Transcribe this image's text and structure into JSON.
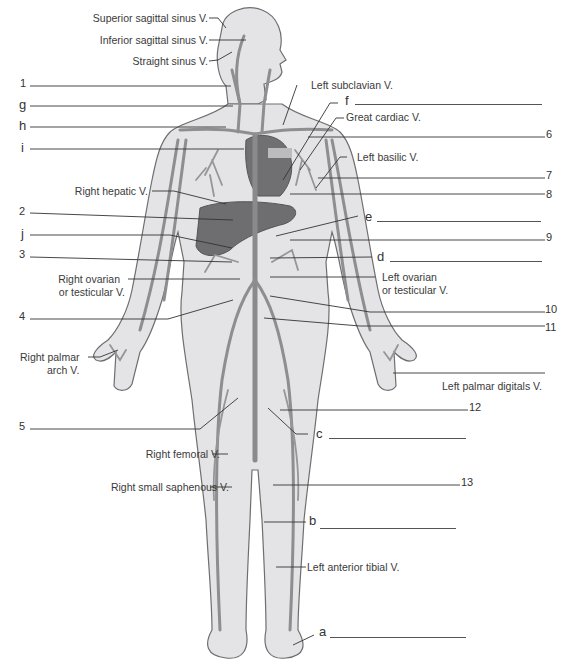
{
  "figure": {
    "named_labels": {
      "superior_sagittal_sinus": "Superior sagittal sinus  V.",
      "inferior_sagittal_sinus": "Inferior sagittal sinus  V.",
      "straight_sinus": "Straight sinus  V.",
      "left_subclavian": "Left subclavian  V.",
      "great_cardiac": "Great cardiac  V.",
      "left_basilic": "Left basilic  V.",
      "right_hepatic": "Right hepatic  V.",
      "right_ovarian_line1": "Right ovarian",
      "right_ovarian_line2": "or testicular  V.",
      "left_ovarian_line1": "Left ovarian",
      "left_ovarian_line2": "or testicular  V.",
      "right_palmar_arch_line1": "Right palmar",
      "right_palmar_arch_line2": "arch  V.",
      "left_palmar_digitals": "Left palmar digitals  V.",
      "right_femoral": "Right femoral  V.",
      "right_small_saphenous": "Right small saphenous  V.",
      "left_anterior_tibial": "Left anterior tibial  V."
    },
    "numbered_callouts": [
      "1",
      "2",
      "3",
      "4",
      "5",
      "6",
      "7",
      "8",
      "9",
      "10",
      "11",
      "12",
      "13"
    ],
    "lettered_blanks": [
      "a",
      "b",
      "c",
      "d",
      "e",
      "f",
      "g",
      "h",
      "i",
      "j"
    ]
  }
}
